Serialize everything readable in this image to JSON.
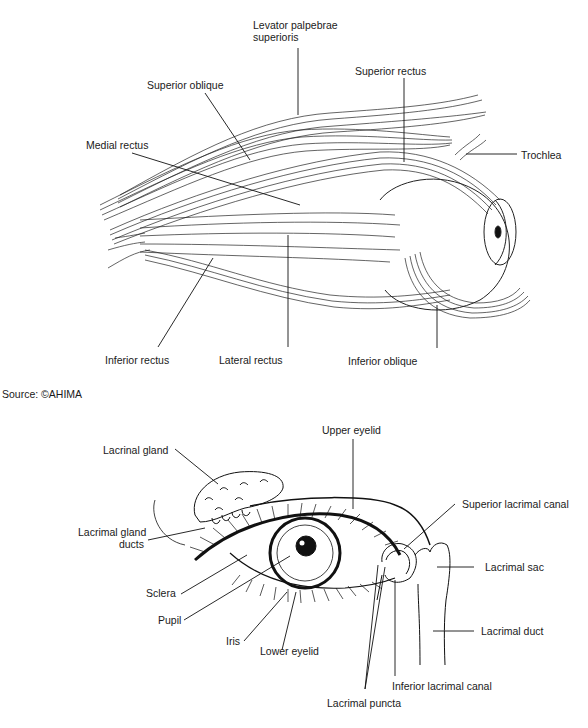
{
  "figure1": {
    "title": "Extraocular muscles",
    "labels": {
      "levator": [
        "Levator palpebrae",
        "superioris"
      ],
      "superior_oblique": "Superior oblique",
      "superior_rectus": "Superior rectus",
      "medial_rectus": "Medial rectus",
      "trochlea": "Trochlea",
      "inferior_rectus": "Inferior rectus",
      "lateral_rectus": "Lateral rectus",
      "inferior_oblique": "Inferior oblique"
    }
  },
  "source": "Source: ©AHIMA",
  "figure2": {
    "title": "Lacrimal apparatus",
    "labels": {
      "lacrinal_gland": "Lacrinal gland",
      "upper_eyelid": "Upper eyelid",
      "superior_lacrimal_canal": "Superior lacrimal canal",
      "lacrimal_gland_ducts": [
        "Lacrimal gland",
        "ducts"
      ],
      "lacrimal_sac": "Lacrimal sac",
      "sclera": "Sclera",
      "pupil": "Pupil",
      "iris": "Iris",
      "lower_eyelid": "Lower eyelid",
      "lacrimal_duct": "Lacrimal duct",
      "inferior_lacrimal_canal": "Inferior lacrimal canal",
      "lacrimal_puncta": "Lacrimal puncta"
    }
  }
}
